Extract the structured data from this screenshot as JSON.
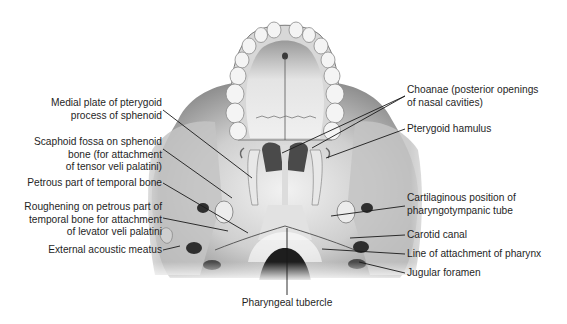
{
  "figure": {
    "labels_left": [
      {
        "id": "medial-plate",
        "lines": [
          "Medial plate of pterygoid",
          "process of sphenoid"
        ]
      },
      {
        "id": "scaphoid-fossa",
        "lines": [
          "Scaphoid fossa on sphenoid",
          "bone (for attachment",
          "of tensor veli palatini)"
        ]
      },
      {
        "id": "petrous-part",
        "lines": [
          "Petrous part of temporal bone"
        ]
      },
      {
        "id": "roughening-petrous",
        "lines": [
          "Roughening on petrous part of",
          "temporal bone for attachment",
          "of levator veli palatini"
        ]
      },
      {
        "id": "external-acoustic-meatus",
        "lines": [
          "External acoustic meatus"
        ]
      }
    ],
    "labels_right": [
      {
        "id": "choanae",
        "lines": [
          "Choanae (posterior openings",
          "of nasal cavities)"
        ]
      },
      {
        "id": "pterygoid-hamulus",
        "lines": [
          "Pterygoid hamulus"
        ]
      },
      {
        "id": "cartilaginous-tube",
        "lines": [
          "Cartilaginous position of",
          "pharyngotympanic tube"
        ]
      },
      {
        "id": "carotid-canal",
        "lines": [
          "Carotid canal"
        ]
      },
      {
        "id": "line-attachment-pharynx",
        "lines": [
          "Line of attachment of pharynx"
        ]
      },
      {
        "id": "jugular-foramen",
        "lines": [
          "Jugular foramen"
        ]
      }
    ],
    "labels_bottom": [
      {
        "id": "pharyngeal-tubercle",
        "lines": [
          "Pharyngeal tubercle"
        ]
      }
    ],
    "colors": {
      "background": "#ffffff",
      "bone_light": "#e6e6e6",
      "bone_mid": "#b9b9b9",
      "bone_dark": "#6e6e6e",
      "foramen": "#262626",
      "leader_line": "#1a1a1a",
      "attachment_line": "#5a5a5a"
    }
  }
}
